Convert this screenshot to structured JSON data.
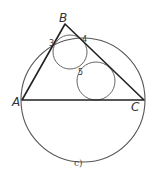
{
  "figure": {
    "caption": "c)",
    "vertices": {
      "A": {
        "label": "A",
        "x": 22,
        "y": 100
      },
      "B": {
        "label": "B",
        "x": 65,
        "y": 24
      },
      "C": {
        "label": "C",
        "x": 144,
        "y": 100
      }
    },
    "tangent_points": [
      {
        "label": "3",
        "x": 53,
        "y": 45
      },
      {
        "label": "4",
        "x": 84,
        "y": 40
      },
      {
        "label": "5",
        "x": 80,
        "y": 67
      }
    ],
    "circumcircle": {
      "cx": 83,
      "cy": 100,
      "r": 62
    },
    "small_circles": [
      {
        "name": "upper-circle",
        "cx": 70,
        "cy": 52,
        "r": 17
      },
      {
        "name": "lower-circle",
        "cx": 96,
        "cy": 81,
        "r": 19
      }
    ],
    "colors": {
      "triangle_stroke": "#222222",
      "circle_stroke": "#555555",
      "background": "#ffffff"
    }
  }
}
